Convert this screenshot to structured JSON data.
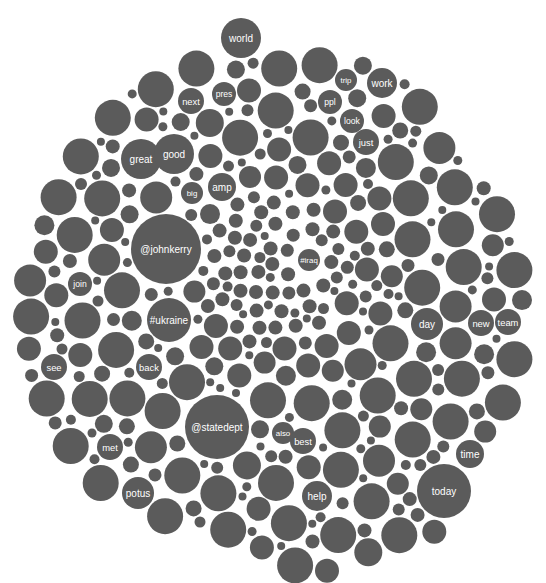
{
  "chart_data": {
    "type": "bubble",
    "title": "",
    "colors": {
      "bubble": "#5b5b5b",
      "label": "#ffffff",
      "background": "#ffffff"
    },
    "labeled_bubbles": [
      {
        "label": "world",
        "cx": 241,
        "cy": 38,
        "r": 20
      },
      {
        "label": "trip",
        "cx": 346,
        "cy": 80,
        "r": 11
      },
      {
        "label": "work",
        "cx": 382,
        "cy": 83,
        "r": 15
      },
      {
        "label": "pres",
        "cx": 224,
        "cy": 94,
        "r": 12
      },
      {
        "label": "next",
        "cx": 191,
        "cy": 101,
        "r": 13
      },
      {
        "label": "ppl",
        "cx": 330,
        "cy": 102,
        "r": 12
      },
      {
        "label": "look",
        "cx": 352,
        "cy": 121,
        "r": 12
      },
      {
        "label": "just",
        "cx": 366,
        "cy": 142,
        "r": 13
      },
      {
        "label": "great",
        "cx": 141,
        "cy": 159,
        "r": 20
      },
      {
        "label": "good",
        "cx": 174,
        "cy": 154,
        "r": 20
      },
      {
        "label": "big",
        "cx": 192,
        "cy": 193,
        "r": 11
      },
      {
        "label": "amp",
        "cx": 222,
        "cy": 187,
        "r": 14
      },
      {
        "label": "@johnkerry",
        "cx": 166,
        "cy": 249,
        "r": 35
      },
      {
        "label": "#iraq",
        "cx": 309,
        "cy": 260,
        "r": 11
      },
      {
        "label": "join",
        "cx": 80,
        "cy": 284,
        "r": 12
      },
      {
        "label": "#ukraine",
        "cx": 169,
        "cy": 320,
        "r": 22
      },
      {
        "label": "day",
        "cx": 427,
        "cy": 324,
        "r": 16
      },
      {
        "label": "new",
        "cx": 481,
        "cy": 323,
        "r": 13
      },
      {
        "label": "team",
        "cx": 508,
        "cy": 322,
        "r": 13
      },
      {
        "label": "see",
        "cx": 54,
        "cy": 367,
        "r": 13
      },
      {
        "label": "back",
        "cx": 149,
        "cy": 367,
        "r": 13
      },
      {
        "label": "@statedept",
        "cx": 217,
        "cy": 427,
        "r": 32
      },
      {
        "label": "also",
        "cx": 283,
        "cy": 433,
        "r": 11
      },
      {
        "label": "best",
        "cx": 303,
        "cy": 441,
        "r": 13
      },
      {
        "label": "met",
        "cx": 110,
        "cy": 447,
        "r": 13
      },
      {
        "label": "time",
        "cx": 470,
        "cy": 454,
        "r": 14
      },
      {
        "label": "help",
        "cx": 317,
        "cy": 496,
        "r": 15
      },
      {
        "label": "today",
        "cx": 444,
        "cy": 491,
        "r": 27
      },
      {
        "label": "potus",
        "cx": 138,
        "cy": 493,
        "r": 16
      }
    ],
    "layout": {
      "width": 546,
      "height": 583,
      "pack_center": [
        272,
        318
      ],
      "unlabeled_bubbles": "many small filler circles (r≈4–18), denser/smaller near center"
    }
  }
}
